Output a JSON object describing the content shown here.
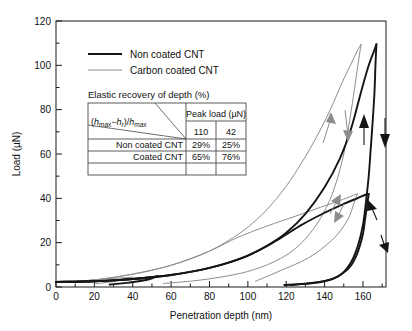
{
  "chart_data": {
    "type": "line",
    "title": "",
    "xlabel": "Penetration depth (nm)",
    "ylabel": "Load (µN)",
    "xlim": [
      0,
      172
    ],
    "ylim": [
      0,
      120
    ],
    "xticks": [
      0,
      20,
      40,
      60,
      80,
      100,
      120,
      140,
      160
    ],
    "yticks": [
      0,
      20,
      40,
      60,
      80,
      100,
      120
    ],
    "x_minor_step": 10,
    "y_minor_step": 10,
    "grid": false,
    "legend_position": "upper-left-inside",
    "series": [
      {
        "name": "Non coated CNT",
        "color": "#151515",
        "style": "thick-black",
        "cycles": [
          {
            "peak_load": 110,
            "max_depth": 167,
            "residual_depth": 119,
            "loading_points": [
              [
                0,
                2.3
              ],
              [
                10,
                2.4
              ],
              [
                20,
                2.6
              ],
              [
                30,
                3.0
              ],
              [
                40,
                3.6
              ],
              [
                50,
                4.4
              ],
              [
                60,
                5.4
              ],
              [
                70,
                6.8
              ],
              [
                80,
                8.6
              ],
              [
                90,
                11.0
              ],
              [
                100,
                14.2
              ],
              [
                110,
                18.6
              ],
              [
                120,
                24.5
              ],
              [
                130,
                33.0
              ],
              [
                140,
                45.0
              ],
              [
                148,
                58.0
              ],
              [
                154,
                72.0
              ],
              [
                159,
                88.0
              ],
              [
                163,
                100.0
              ],
              [
                166,
                107.0
              ],
              [
                167,
                109.5
              ]
            ],
            "unloading_points": [
              [
                167,
                109.5
              ],
              [
                166.5,
                100.0
              ],
              [
                166,
                88.0
              ],
              [
                165,
                74.0
              ],
              [
                164,
                62.0
              ],
              [
                163,
                50.0
              ],
              [
                161.5,
                38.0
              ],
              [
                160,
                28.0
              ],
              [
                157.5,
                19.0
              ],
              [
                154,
                11.5
              ],
              [
                149,
                6.0
              ],
              [
                142,
                3.0
              ],
              [
                132,
                1.6
              ],
              [
                119,
                0.9
              ]
            ]
          },
          {
            "peak_load": 42,
            "max_depth": 163,
            "residual_depth": 122,
            "loading_points": [
              [
                0,
                2.3
              ],
              [
                20,
                2.6
              ],
              [
                40,
                3.6
              ],
              [
                60,
                5.4
              ],
              [
                80,
                8.6
              ],
              [
                100,
                14.2
              ],
              [
                115,
                21.0
              ],
              [
                128,
                28.0
              ],
              [
                140,
                33.5
              ],
              [
                150,
                37.5
              ],
              [
                157,
                40.0
              ],
              [
                161,
                41.5
              ],
              [
                163,
                42.0
              ]
            ],
            "unloading_points": [
              [
                163,
                42.0
              ],
              [
                162,
                36.0
              ],
              [
                161,
                30.0
              ],
              [
                160,
                24.0
              ],
              [
                158.5,
                19.0
              ],
              [
                156.5,
                14.0
              ],
              [
                154,
                10.0
              ],
              [
                150,
                6.5
              ],
              [
                145,
                4.0
              ],
              [
                138,
                2.4
              ],
              [
                130,
                1.5
              ],
              [
                122,
                0.9
              ]
            ]
          },
          {
            "peak_load": 5,
            "max_depth": 53,
            "residual_depth": 28,
            "loading_points": [
              [
                0,
                2.3
              ],
              [
                10,
                2.4
              ],
              [
                20,
                2.6
              ],
              [
                30,
                3.0
              ],
              [
                40,
                3.6
              ],
              [
                48,
                4.3
              ],
              [
                53,
                4.9
              ]
            ],
            "unloading_points": [
              [
                53,
                4.9
              ],
              [
                49,
                3.6
              ],
              [
                44,
                2.7
              ],
              [
                38,
                2.0
              ],
              [
                33,
                1.5
              ],
              [
                28,
                1.1
              ]
            ]
          }
        ]
      },
      {
        "name": "Carbon coated CNT",
        "color": "#8d8d8d",
        "style": "thin-gray",
        "cycles": [
          {
            "peak_load": 110,
            "max_depth": 159,
            "residual_depth": 56,
            "loading_points": [
              [
                0,
                2.2
              ],
              [
                10,
                2.5
              ],
              [
                20,
                3.2
              ],
              [
                30,
                4.4
              ],
              [
                40,
                5.8
              ],
              [
                50,
                7.6
              ],
              [
                60,
                9.8
              ],
              [
                70,
                12.6
              ],
              [
                80,
                16.2
              ],
              [
                90,
                21.0
              ],
              [
                100,
                27.0
              ],
              [
                110,
                35.0
              ],
              [
                120,
                45.5
              ],
              [
                128,
                56.0
              ],
              [
                136,
                68.0
              ],
              [
                143,
                80.0
              ],
              [
                149,
                92.0
              ],
              [
                154,
                101.0
              ],
              [
                157,
                106.5
              ],
              [
                159,
                109.5
              ]
            ],
            "unloading_points": [
              [
                159,
                109.5
              ],
              [
                157,
                98.0
              ],
              [
                155,
                86.0
              ],
              [
                152.5,
                72.0
              ],
              [
                150,
                60.0
              ],
              [
                146,
                47.0
              ],
              [
                141,
                36.0
              ],
              [
                134,
                26.0
              ],
              [
                125,
                17.5
              ],
              [
                114,
                11.5
              ],
              [
                100,
                7.0
              ],
              [
                86,
                4.5
              ],
              [
                72,
                2.8
              ],
              [
                56,
                1.6
              ]
            ]
          },
          {
            "peak_load": 42,
            "max_depth": 157,
            "residual_depth": 104,
            "loading_points": [
              [
                0,
                2.2
              ],
              [
                20,
                3.2
              ],
              [
                40,
                5.8
              ],
              [
                60,
                9.8
              ],
              [
                80,
                16.2
              ],
              [
                95,
                22.5
              ],
              [
                110,
                27.5
              ],
              [
                125,
                32.0
              ],
              [
                138,
                36.0
              ],
              [
                148,
                39.0
              ],
              [
                154,
                41.0
              ],
              [
                157,
                42.0
              ]
            ],
            "unloading_points": [
              [
                157,
                42.0
              ],
              [
                155,
                37.0
              ],
              [
                153,
                32.0
              ],
              [
                150,
                27.5
              ],
              [
                146,
                23.0
              ],
              [
                141,
                19.0
              ],
              [
                135,
                15.0
              ],
              [
                128,
                11.5
              ],
              [
                120,
                8.5
              ],
              [
                112,
                5.5
              ],
              [
                104,
                2.6
              ]
            ]
          },
          {
            "peak_load": 4,
            "max_depth": 40,
            "residual_depth": 20,
            "loading_points": [
              [
                0,
                2.2
              ],
              [
                10,
                2.5
              ],
              [
                20,
                3.2
              ],
              [
                30,
                3.9
              ],
              [
                40,
                4.4
              ]
            ],
            "unloading_points": [
              [
                40,
                4.4
              ],
              [
                35,
                3.2
              ],
              [
                30,
                2.5
              ],
              [
                25,
                1.9
              ],
              [
                20,
                1.4
              ]
            ]
          }
        ]
      }
    ],
    "annotations": [
      {
        "name": "loading-arrow-gray-upper",
        "direction": "up"
      },
      {
        "name": "unloading-arrow-gray-upper",
        "direction": "down"
      },
      {
        "name": "loading-arrow-black-upper",
        "direction": "up"
      },
      {
        "name": "unloading-arrow-black-upper",
        "direction": "down"
      },
      {
        "name": "loading-arrow-gray-lower",
        "direction": "up"
      },
      {
        "name": "unloading-arrow-gray-lower",
        "direction": "down"
      },
      {
        "name": "loading-arrow-black-lower",
        "direction": "up"
      },
      {
        "name": "unloading-arrow-black-lower",
        "direction": "down"
      }
    ]
  },
  "legend": {
    "entries": [
      {
        "label": "Non coated CNT",
        "color": "#151515"
      },
      {
        "label": "Carbon coated CNT",
        "color": "#8d8d8d"
      }
    ]
  },
  "inset_table": {
    "caption": "Elastic recovery of depth (%)",
    "corner_formula": "(h",
    "corner_formula_parts": {
      "open": "(",
      "h1": "h",
      "sub1": "max",
      "minus": "−",
      "h2": "h",
      "sub2": "r",
      "close": ")/",
      "h3": "h",
      "sub3": "max"
    },
    "group_header": "Peak load (µN)",
    "column_headers": [
      "110",
      "42"
    ],
    "rows": [
      {
        "label": "Non coated CNT",
        "values": [
          "29%",
          "25%"
        ]
      },
      {
        "label": "Coated CNT",
        "values": [
          "65%",
          "76%"
        ]
      }
    ]
  },
  "axes": {
    "x_title": "Penetration depth (nm)",
    "y_title": "Load (µN)",
    "x_tick_labels": [
      "0",
      "20",
      "40",
      "60",
      "80",
      "100",
      "120",
      "140",
      "160"
    ],
    "y_tick_labels": [
      "0",
      "20",
      "40",
      "60",
      "80",
      "100",
      "120"
    ]
  }
}
